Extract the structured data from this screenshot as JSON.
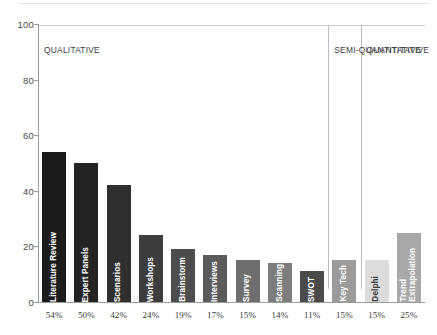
{
  "top_rule": {
    "color": "#e2e2e4"
  },
  "chart_data": {
    "type": "bar",
    "title": "",
    "subtitle": "",
    "xlabel": "",
    "ylabel": "",
    "ylim": [
      0,
      100
    ],
    "yticks": [
      0,
      20,
      40,
      60,
      80,
      100
    ],
    "ytick_labels": [
      "0",
      "20",
      "40",
      "60",
      "80",
      "100"
    ],
    "grid": false,
    "legend": null,
    "categories": [
      "Literature Review",
      "Expert Panels",
      "Scenarios",
      "Workshops",
      "Brainstorm",
      "Interviews",
      "Survey",
      "Scanning",
      "SWOT",
      "Key Tech",
      "Delphi",
      "Trend Extrapolation"
    ],
    "values": [
      54,
      50,
      42,
      24,
      19,
      17,
      15,
      14,
      11,
      15,
      15,
      25
    ],
    "data_labels": [
      "54%",
      "50%",
      "42%",
      "24%",
      "19%",
      "17%",
      "15%",
      "14%",
      "11%",
      "15%",
      "15%",
      "25%"
    ],
    "bar_colors": [
      "#1c1c1c",
      "#242424",
      "#2f2f2f",
      "#3d3d3d",
      "#4d4d4d",
      "#5b5b5b",
      "#6e6e6e",
      "#7d7d7d",
      "#4a4a4a",
      "#9b9b9b",
      "#dcdcdc",
      "#a8a8a8"
    ],
    "bar_label_colors": [
      "#ffffff",
      "#ffffff",
      "#ffffff",
      "#ffffff",
      "#ffffff",
      "#ffffff",
      "#ffffff",
      "#ffffff",
      "#ffffff",
      "#ffffff",
      "#3a3a3a",
      "#ffffff"
    ],
    "bar_label_lines": [
      [
        "Literature Review"
      ],
      [
        "Expert Panels"
      ],
      [
        "Scenarios"
      ],
      [
        "Workshops"
      ],
      [
        "Brainstorm"
      ],
      [
        "Interviews"
      ],
      [
        "Survey"
      ],
      [
        "Scanning"
      ],
      [
        "SWOT"
      ],
      [
        "Key Tech"
      ],
      [
        "Delphi"
      ],
      [
        "Trend",
        "Extrapolation"
      ]
    ],
    "groups": [
      {
        "label": "QUALITATIVE",
        "start_index": 0,
        "end_index": 8
      },
      {
        "label": "SEMI-QUANTITATIVE",
        "start_index": 9,
        "end_index": 9
      },
      {
        "label": "QUANTITATIVE",
        "start_index": 10,
        "end_index": 11
      }
    ],
    "axis_color": "#9a9a9a",
    "separator_color": "#bdbdc0"
  }
}
